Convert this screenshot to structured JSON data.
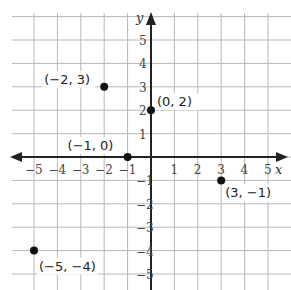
{
  "diagram": {
    "type": "coordinate-plane",
    "axes": {
      "x_label": "x",
      "y_label": "y"
    },
    "x_ticks": [
      "−5",
      "−4",
      "−3",
      "−2",
      "−1",
      "1",
      "2",
      "3",
      "4",
      "5"
    ],
    "y_ticks": [
      "5",
      "4",
      "3",
      "2",
      "1",
      "1",
      "2",
      "3",
      "4",
      "5"
    ],
    "y_ticks_negative": [
      "−1",
      "−2",
      "−3",
      "−4",
      "−5"
    ],
    "points": [
      {
        "x": -2,
        "y": 3,
        "label": "(−2, 3)"
      },
      {
        "x": 0,
        "y": 2,
        "label": "(0, 2)"
      },
      {
        "x": -1,
        "y": 0,
        "label": "(−1, 0)"
      },
      {
        "x": 3,
        "y": -1,
        "label": "(3, −1)"
      },
      {
        "x": -5,
        "y": -4,
        "label": "(−5, −4)"
      }
    ],
    "colors": {
      "grid": "#b8b8b8",
      "axis": "#222222",
      "point": "#111111"
    }
  }
}
